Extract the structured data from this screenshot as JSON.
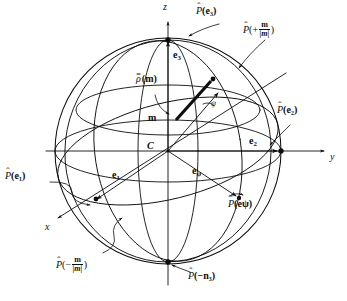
{
  "figure": {
    "type": "geometric-diagram",
    "center_label": "C",
    "colors": {
      "ink": "#0d0d0d",
      "background": "#ffffff"
    },
    "geometry": {
      "center": [
        168,
        151
      ],
      "radius": 113,
      "north_pole": [
        168,
        40
      ],
      "south_pole": [
        168,
        262
      ],
      "equator_rx": 113,
      "equator_ry": 31
    }
  },
  "axes": [
    {
      "name": "z-axis",
      "label": "z",
      "label_pos": [
        163,
        4
      ],
      "direction": "vertical-up"
    },
    {
      "name": "y-axis",
      "label": "y",
      "label_pos": [
        330,
        155
      ],
      "direction": "horizontal-right"
    },
    {
      "name": "x-axis",
      "label": "x",
      "label_pos": [
        45,
        227
      ],
      "direction": "oblique-lower-left"
    }
  ],
  "vectors": [
    {
      "name": "e1",
      "base": "e",
      "sub": "1",
      "label_pos": [
        112,
        177
      ]
    },
    {
      "name": "e2",
      "base": "e",
      "sub": "2",
      "label_pos": [
        249,
        142
      ]
    },
    {
      "name": "e3",
      "base": "e",
      "sub": "3",
      "label_pos": [
        173,
        55
      ]
    },
    {
      "name": "epsi",
      "base": "e",
      "sub": "ψ",
      "label_pos": [
        192,
        172
      ]
    },
    {
      "name": "m",
      "base": "m",
      "sub": "",
      "label_pos": [
        148,
        118
      ]
    }
  ],
  "angle_marker": {
    "name": "psi-angle",
    "label": "ψ",
    "label_pos": [
      213,
      105
    ]
  },
  "labels": {
    "rho_m": {
      "text_pre": "ρ",
      "text_post": "(m)",
      "accent": "=",
      "pos": [
        139,
        79
      ]
    },
    "P_e3": {
      "pos": [
        196,
        11
      ],
      "arg": "(e₃)"
    },
    "P_e2": {
      "pos": [
        277,
        110
      ],
      "arg": "(e₂)"
    },
    "P_e1": {
      "pos": [
        6,
        176
      ],
      "arg": "(e₁)"
    },
    "P_epsi": {
      "pos": [
        228,
        204
      ],
      "arg": "(eψ)"
    },
    "P_plus_m": {
      "pos": [
        243,
        27
      ],
      "sign": "+",
      "num": "m",
      "den": "|m|"
    },
    "P_minus_m": {
      "pos": [
        58,
        262
      ],
      "sign": "−",
      "num": "m",
      "den": "|m|"
    },
    "P_minus_n3": {
      "pos": [
        188,
        276
      ],
      "arg": "(−n₃)"
    }
  },
  "text": {
    "P": "P",
    "hat": "ˆ",
    "paren_open": "(",
    "paren_close": ")"
  }
}
